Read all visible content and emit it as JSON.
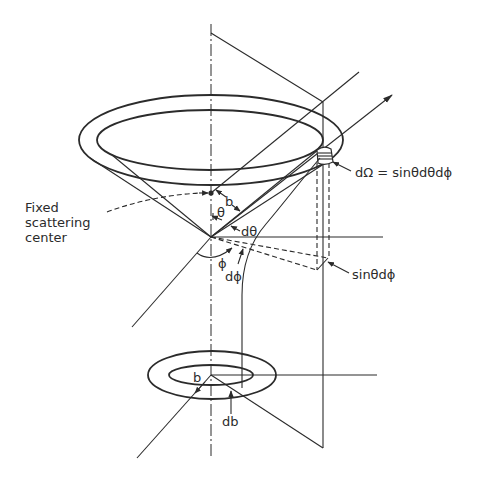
{
  "figure": {
    "type": "scattering-geometry-diagram",
    "labels": {
      "fixed_scattering_center": {
        "line1": "Fixed",
        "line2": "scattering",
        "line3": "center"
      },
      "impact_parameter_upper": "b",
      "theta": "θ",
      "d_theta": "dθ",
      "phi": "ϕ",
      "d_phi": "dϕ",
      "solid_angle": "dΩ = sinθdθdϕ",
      "sin_theta_d_phi": "sinθdϕ",
      "impact_parameter_lower": "b",
      "d_b": "db"
    },
    "colors": {
      "line": "#2b2b2b",
      "background": "#ffffff"
    }
  }
}
